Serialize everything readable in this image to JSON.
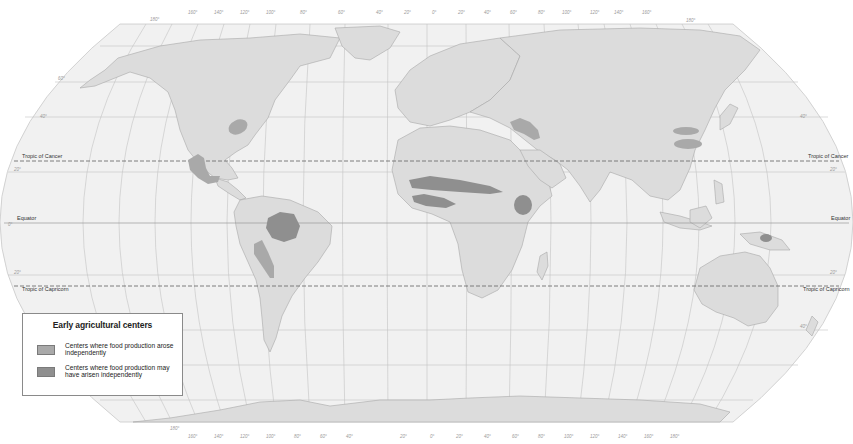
{
  "map": {
    "type": "world map",
    "projection": "Robinson-like",
    "colors": {
      "ocean": "#f1f1f1",
      "land": "#dcdcdc",
      "center_arose": "#a9a9a9",
      "center_may_have": "#8f8f8f",
      "graticule": "#c2c2c2",
      "tropic_line": "#6f6f6f"
    },
    "reference_lines": {
      "tropic_of_cancer": "Tropic of Cancer",
      "equator": "Equator",
      "tropic_of_capricorn": "Tropic of Capricorn"
    },
    "latitude_ticks": {
      "lat_40": "40°",
      "lat_20": "20°",
      "lat_0": "0°",
      "lat_s20": "20°",
      "lat_s40": "40°",
      "lat_60": "60°"
    },
    "top_longitude_ticks": [
      "180°",
      "160°",
      "140°",
      "120°",
      "100°",
      "80°",
      "60°",
      "40°",
      "20°",
      "0°",
      "20°",
      "40°",
      "60°",
      "80°",
      "100°",
      "120°",
      "140°",
      "160°",
      "180°"
    ],
    "bottom_longitude_ticks": [
      "180°",
      "160°",
      "140°",
      "120°",
      "100°",
      "80°",
      "60°",
      "40°",
      "20°",
      "0°",
      "20°",
      "40°",
      "60°",
      "80°",
      "100°",
      "120°",
      "140°",
      "160°",
      "180°"
    ],
    "centers": [
      {
        "name": "Eastern North America",
        "type": "arose"
      },
      {
        "name": "Mesoamerica",
        "type": "arose"
      },
      {
        "name": "Amazonia",
        "type": "may_have"
      },
      {
        "name": "Andes",
        "type": "arose"
      },
      {
        "name": "Fertile Crescent",
        "type": "arose"
      },
      {
        "name": "Sahel",
        "type": "may_have"
      },
      {
        "name": "West Africa",
        "type": "may_have"
      },
      {
        "name": "Ethiopia",
        "type": "may_have"
      },
      {
        "name": "North China",
        "type": "arose"
      },
      {
        "name": "South China",
        "type": "arose"
      },
      {
        "name": "New Guinea",
        "type": "may_have"
      }
    ]
  },
  "legend": {
    "title": "Early agricultural centers",
    "items": [
      {
        "label": "Centers where food production arose independently",
        "color": "#a9a9a9"
      },
      {
        "label": "Centers where food production may have arisen independently",
        "color": "#8f8f8f"
      }
    ]
  }
}
